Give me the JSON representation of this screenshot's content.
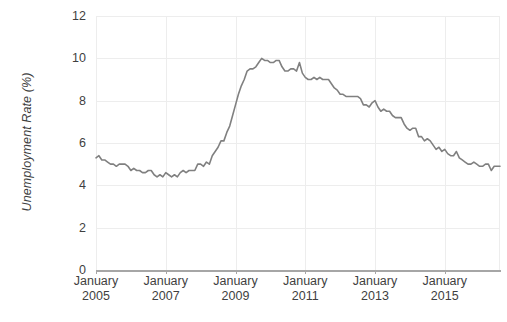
{
  "chart_data": {
    "type": "line",
    "title": "",
    "xlabel": "",
    "ylabel": "Unemployment Rate (%)",
    "ylim": [
      0,
      12
    ],
    "yticks": [
      0,
      2,
      4,
      6,
      8,
      10,
      12
    ],
    "ytick_labels": [
      "0",
      "2",
      "4",
      "6",
      "8",
      "10",
      "12"
    ],
    "xtick_labels": [
      {
        "line1": "January",
        "line2": "2005"
      },
      {
        "line1": "January",
        "line2": "2007"
      },
      {
        "line1": "January",
        "line2": "2009"
      },
      {
        "line1": "January",
        "line2": "2011"
      },
      {
        "line1": "January",
        "line2": "2013"
      },
      {
        "line1": "January",
        "line2": "2015"
      }
    ],
    "grid": true,
    "grid_horizontal": true,
    "grid_vertical": true,
    "legend": false,
    "legend_position": "none",
    "line_color": "#808080",
    "line_width": 1.6,
    "grid_color": "#ededed",
    "axis_color": "#a6a6a6",
    "text_color": "#3f3f3f",
    "x_start_label": "January 2005",
    "x_end_label": "2016",
    "series": [
      {
        "name": "Unemployment Rate",
        "x": [
          "2005-01",
          "2005-02",
          "2005-03",
          "2005-04",
          "2005-05",
          "2005-06",
          "2005-07",
          "2005-08",
          "2005-09",
          "2005-10",
          "2005-11",
          "2005-12",
          "2006-01",
          "2006-02",
          "2006-03",
          "2006-04",
          "2006-05",
          "2006-06",
          "2006-07",
          "2006-08",
          "2006-09",
          "2006-10",
          "2006-11",
          "2006-12",
          "2007-01",
          "2007-02",
          "2007-03",
          "2007-04",
          "2007-05",
          "2007-06",
          "2007-07",
          "2007-08",
          "2007-09",
          "2007-10",
          "2007-11",
          "2007-12",
          "2008-01",
          "2008-02",
          "2008-03",
          "2008-04",
          "2008-05",
          "2008-06",
          "2008-07",
          "2008-08",
          "2008-09",
          "2008-10",
          "2008-11",
          "2008-12",
          "2009-01",
          "2009-02",
          "2009-03",
          "2009-04",
          "2009-05",
          "2009-06",
          "2009-07",
          "2009-08",
          "2009-09",
          "2009-10",
          "2009-11",
          "2009-12",
          "2010-01",
          "2010-02",
          "2010-03",
          "2010-04",
          "2010-05",
          "2010-06",
          "2010-07",
          "2010-08",
          "2010-09",
          "2010-10",
          "2010-11",
          "2010-12",
          "2011-01",
          "2011-02",
          "2011-03",
          "2011-04",
          "2011-05",
          "2011-06",
          "2011-07",
          "2011-08",
          "2011-09",
          "2011-10",
          "2011-11",
          "2011-12",
          "2012-01",
          "2012-02",
          "2012-03",
          "2012-04",
          "2012-05",
          "2012-06",
          "2012-07",
          "2012-08",
          "2012-09",
          "2012-10",
          "2012-11",
          "2012-12",
          "2013-01",
          "2013-02",
          "2013-03",
          "2013-04",
          "2013-05",
          "2013-06",
          "2013-07",
          "2013-08",
          "2013-09",
          "2013-10",
          "2013-11",
          "2013-12",
          "2014-01",
          "2014-02",
          "2014-03",
          "2014-04",
          "2014-05",
          "2014-06",
          "2014-07",
          "2014-08",
          "2014-09",
          "2014-10",
          "2014-11",
          "2014-12",
          "2015-01",
          "2015-02",
          "2015-03",
          "2015-04",
          "2015-05",
          "2015-06",
          "2015-07",
          "2015-08",
          "2015-09",
          "2015-10",
          "2015-11",
          "2015-12",
          "2016-01",
          "2016-02",
          "2016-03",
          "2016-04",
          "2016-05",
          "2016-06",
          "2016-07",
          "2016-08"
        ],
        "values": [
          5.3,
          5.4,
          5.2,
          5.2,
          5.1,
          5.0,
          5.0,
          4.9,
          5.0,
          5.0,
          5.0,
          4.9,
          4.7,
          4.8,
          4.7,
          4.7,
          4.6,
          4.6,
          4.7,
          4.7,
          4.5,
          4.4,
          4.5,
          4.4,
          4.6,
          4.5,
          4.4,
          4.5,
          4.4,
          4.6,
          4.7,
          4.6,
          4.7,
          4.7,
          4.7,
          5.0,
          5.0,
          4.9,
          5.1,
          5.0,
          5.4,
          5.6,
          5.8,
          6.1,
          6.1,
          6.5,
          6.8,
          7.3,
          7.8,
          8.3,
          8.7,
          9.0,
          9.4,
          9.5,
          9.5,
          9.6,
          9.8,
          10.0,
          9.9,
          9.9,
          9.8,
          9.8,
          9.9,
          9.9,
          9.6,
          9.4,
          9.4,
          9.5,
          9.5,
          9.4,
          9.8,
          9.3,
          9.1,
          9.0,
          9.0,
          9.1,
          9.0,
          9.1,
          9.0,
          9.0,
          9.0,
          8.8,
          8.6,
          8.5,
          8.3,
          8.3,
          8.2,
          8.2,
          8.2,
          8.2,
          8.2,
          8.1,
          7.8,
          7.8,
          7.7,
          7.9,
          8.0,
          7.7,
          7.5,
          7.6,
          7.5,
          7.5,
          7.3,
          7.2,
          7.2,
          7.2,
          6.9,
          6.7,
          6.6,
          6.7,
          6.7,
          6.3,
          6.3,
          6.1,
          6.2,
          6.1,
          5.9,
          5.7,
          5.8,
          5.6,
          5.7,
          5.5,
          5.4,
          5.4,
          5.6,
          5.3,
          5.2,
          5.1,
          5.0,
          5.0,
          5.1,
          5.0,
          4.9,
          4.9,
          5.0,
          5.0,
          4.7,
          4.9,
          4.9,
          4.9
        ]
      }
    ]
  }
}
